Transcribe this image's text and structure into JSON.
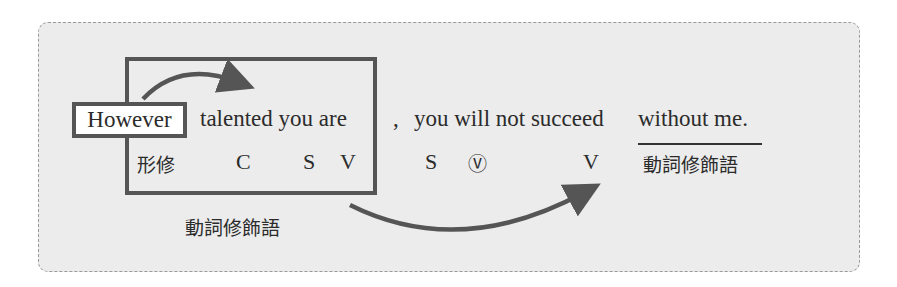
{
  "sentence": {
    "however": "However",
    "clause": "talented you are",
    "comma": ",",
    "main": "you will not succeed",
    "modifier": "without me."
  },
  "labels": {
    "adj_mod": "形修",
    "c": "C",
    "s1": "S",
    "v1": "V",
    "s2": "S",
    "aux_v": "Ⓥ",
    "v2": "V",
    "verb_mod_right": "動詞修飾語",
    "verb_mod_bottom": "動詞修飾語"
  },
  "colors": {
    "panel_bg": "#ececec",
    "box_border": "#555555",
    "arrow": "#555555"
  }
}
